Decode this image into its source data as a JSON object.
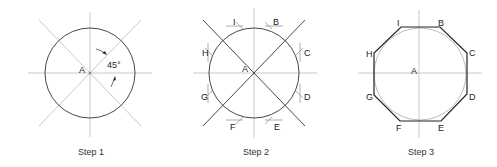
{
  "steps": [
    {
      "caption": "Step 1",
      "center_label": "A",
      "angle_label": "45°"
    },
    {
      "caption": "Step 2",
      "center_label": "A",
      "point_labels": {
        "I": "I",
        "B": "B",
        "C": "C",
        "D": "D",
        "E": "E",
        "F": "F",
        "G": "G",
        "H": "H"
      }
    },
    {
      "caption": "Step 3",
      "center_label": "A",
      "point_labels": {
        "I": "I",
        "B": "B",
        "C": "C",
        "D": "D",
        "E": "E",
        "F": "F",
        "G": "G",
        "H": "H"
      }
    }
  ],
  "colors": {
    "construction_line": "#b8b8b8",
    "dark_line": "#333333",
    "text": "#222222"
  }
}
